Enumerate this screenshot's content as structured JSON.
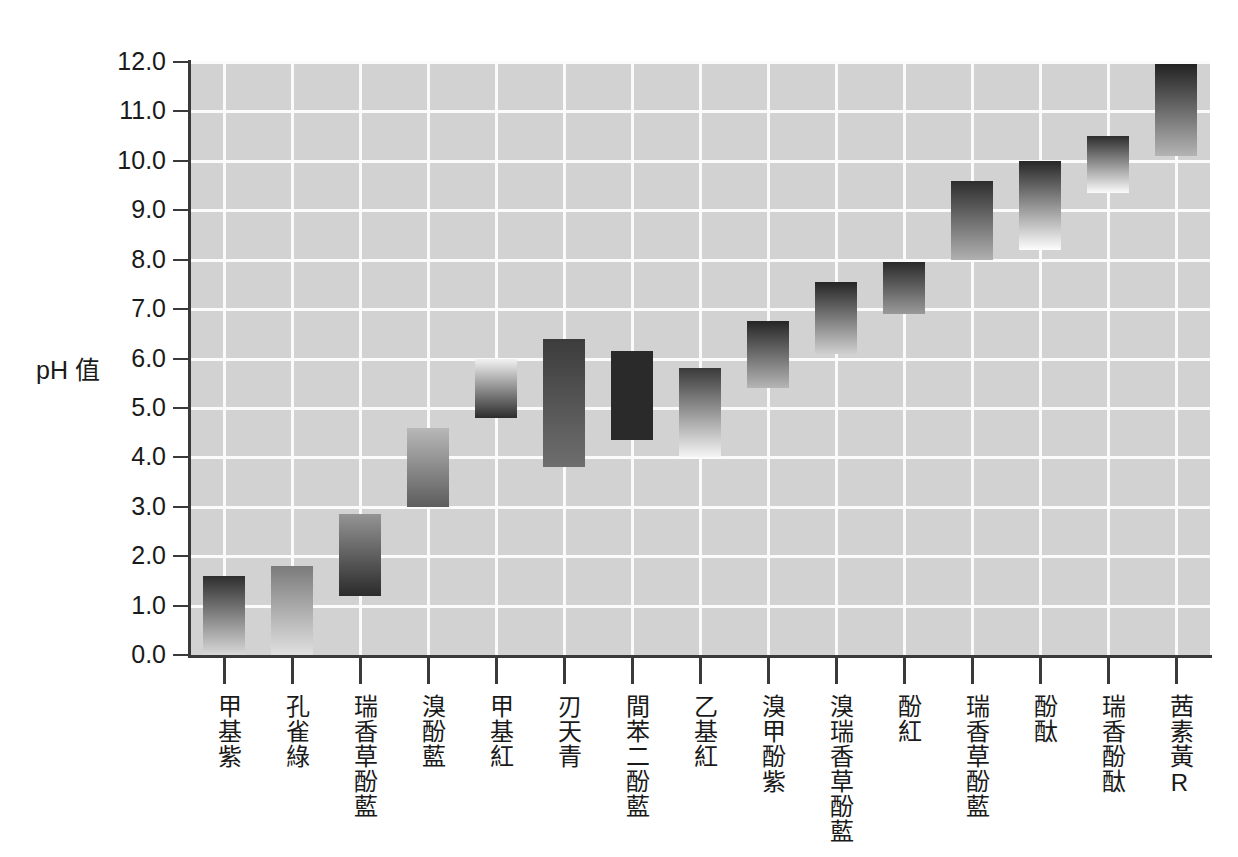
{
  "chart_data": {
    "type": "bar",
    "title": "",
    "subtitle": "",
    "xlabel": "",
    "ylabel": "pH 值",
    "ylim": [
      0.0,
      12.0
    ],
    "ytick_step": 1.0,
    "grid": true,
    "legend": null,
    "orientation": "vertical",
    "bar_style": "floating range bars with vertical colour gradient",
    "yticks": [
      "0.0",
      "1.0",
      "2.0",
      "3.0",
      "4.0",
      "5.0",
      "6.0",
      "7.0",
      "8.0",
      "9.0",
      "10.0",
      "11.0",
      "12.0"
    ],
    "categories": [
      "甲基紫",
      "孔雀綠",
      "瑞香草酚藍",
      "溴酚藍",
      "甲基紅",
      "刃天青",
      "間苯二酚藍",
      "乙基紅",
      "溴甲酚紫",
      "溴瑞香草酚藍",
      "酚紅",
      "瑞香草酚藍",
      "酚酞",
      "瑞香酚酞",
      "茜素黃R"
    ],
    "ranges": [
      {
        "name": "甲基紫",
        "low": 0.0,
        "high": 1.6,
        "color_low": "#d8d8d8",
        "color_high": "#2e2e2e"
      },
      {
        "name": "孔雀綠",
        "low": 0.0,
        "high": 1.8,
        "color_low": "#e0e0e0",
        "color_high": "#7b7b7b"
      },
      {
        "name": "瑞香草酚藍",
        "low": 1.2,
        "high": 2.85,
        "color_low": "#2b2b2b",
        "color_high": "#949494"
      },
      {
        "name": "溴酚藍",
        "low": 3.0,
        "high": 4.6,
        "color_low": "#5d5d5d",
        "color_high": "#b8b8b8"
      },
      {
        "name": "甲基紅",
        "low": 4.8,
        "high": 6.0,
        "color_low": "#2c2c2c",
        "color_high": "#f2f2f2"
      },
      {
        "name": "刃天青",
        "low": 3.8,
        "high": 6.4,
        "color_low": "#6e6e6e",
        "color_high": "#3c3c3c"
      },
      {
        "name": "間苯二酚藍",
        "low": 4.35,
        "high": 6.15,
        "color_low": "#2a2a2a",
        "color_high": "#2a2a2a"
      },
      {
        "name": "乙基紅",
        "low": 4.0,
        "high": 5.8,
        "color_low": "#f4f4f4",
        "color_high": "#3a3a3a"
      },
      {
        "name": "溴甲酚紫",
        "low": 5.4,
        "high": 6.75,
        "color_low": "#b5b5b5",
        "color_high": "#262626"
      },
      {
        "name": "溴瑞香草酚藍",
        "low": 6.1,
        "high": 7.55,
        "color_low": "#cfcfcf",
        "color_high": "#262626"
      },
      {
        "name": "酚紅",
        "low": 6.9,
        "high": 7.95,
        "color_low": "#9a9a9a",
        "color_high": "#2a2a2a"
      },
      {
        "name": "瑞香草酚藍",
        "low": 8.0,
        "high": 9.6,
        "color_low": "#b0b0b0",
        "color_high": "#2d2d2d"
      },
      {
        "name": "酚酞",
        "low": 8.2,
        "high": 10.0,
        "color_low": "#fdfdfd",
        "color_high": "#272727"
      },
      {
        "name": "瑞香酚酞",
        "low": 9.35,
        "high": 10.5,
        "color_low": "#fbfbfb",
        "color_high": "#2d2d2d"
      },
      {
        "name": "茜素黃R",
        "low": 10.1,
        "high": 11.95,
        "color_low": "#b4b4b4",
        "color_high": "#222222"
      }
    ]
  },
  "axis": {
    "y_title": "pH 值"
  },
  "colors": {
    "plot_background": "#d2d2d2",
    "gridline": "#fbfbfb",
    "axis_line": "#3a3a3a",
    "page_background": "#ffffff",
    "text": "#1a1a1a"
  }
}
